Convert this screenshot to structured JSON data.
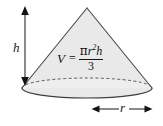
{
  "figure": {
    "shape": "cone",
    "fill_color": "#e9e9e9",
    "outline_color": "#4a4a4a",
    "ink_color": "#141414",
    "background_color": "#ffffff",
    "apex": {
      "x": 87,
      "y": 8
    },
    "base_ellipse": {
      "cx": 87,
      "cy": 88,
      "rx": 65,
      "ry": 10
    }
  },
  "dimensions": {
    "height_label": "h",
    "radius_label": "r",
    "height_arrow": {
      "x": 25,
      "y_top": 8,
      "y_bottom": 84
    },
    "radius_arrow": {
      "y": 109,
      "x_left": 93,
      "x_right": 152
    }
  },
  "formula": {
    "variable": "V",
    "equals": "=",
    "numerator_pi": "π",
    "numerator_r": "r",
    "numerator_exponent": "2",
    "numerator_h": "h",
    "denominator": "3",
    "plain_text": "V = πr²h / 3"
  }
}
